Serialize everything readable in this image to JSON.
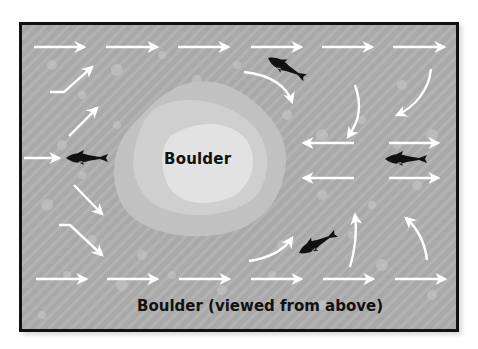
{
  "diagram": {
    "title": "Boulder (viewed from above)",
    "boulder_label": "Boulder",
    "colors": {
      "water": "#a9a9a9",
      "boulder_outer": "#c6c6c6",
      "boulder_inner": "#e0e0e0",
      "arrows": "#ffffff",
      "fish": "#111111",
      "border": "#111111"
    },
    "elements": {
      "flow_arrows": [
        {
          "row": "top",
          "direction": "right",
          "count": 6
        },
        {
          "row": "bottom",
          "direction": "right",
          "count": 6
        },
        {
          "row": "left-upper",
          "direction": "up-right",
          "count": 2
        },
        {
          "row": "left-lower",
          "direction": "down-right",
          "count": 2
        },
        {
          "row": "left-middle",
          "direction": "right",
          "count": 1
        },
        {
          "row": "right-middle",
          "direction": "left",
          "count": 2
        },
        {
          "row": "right-middle",
          "direction": "right",
          "count": 2
        },
        {
          "row": "upper-right-eddy",
          "direction": "curved-down",
          "count": 3
        },
        {
          "row": "lower-right-eddy",
          "direction": "curved-up",
          "count": 3
        }
      ],
      "fish": [
        {
          "position": "left-middle",
          "facing": "left"
        },
        {
          "position": "upper-right",
          "facing": "up-left"
        },
        {
          "position": "right-middle",
          "facing": "left"
        },
        {
          "position": "lower-right",
          "facing": "down-left"
        }
      ]
    }
  }
}
